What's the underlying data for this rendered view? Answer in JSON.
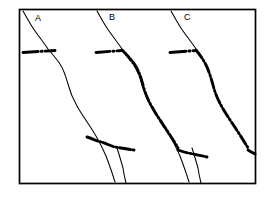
{
  "figure": {
    "type": "line-diagram",
    "panel_count": 3,
    "frame": {
      "x": 19,
      "y": 9,
      "width": 237,
      "height": 175,
      "stroke": "#000000",
      "stroke_width": 1.6
    },
    "background_color": "#ffffff",
    "ink_color": "#000000",
    "caption": ""
  },
  "panels": [
    {
      "id": "A",
      "label": "A",
      "label_x": 35,
      "label_y": 14,
      "thin_curve": "M 22,11 C 28,22 33,27 41,38 C 47,46 50,52 54,62 C 58,72 61,82 68,96 C 76,112 84,128 93,142 C 99,151 104,160 110,173 C 112,178 114,181 116,183",
      "dash_line": "M 22,52 L 50,50",
      "dash_line_2": "M 85,137 L 134,148",
      "dashed_overlay": "",
      "description": "thin sinuous line crossed by short thick dash-dot segments at two levels"
    },
    {
      "id": "B",
      "label": "B",
      "label_x": 109,
      "label_y": 13,
      "thin_curve": "M 96,11 C 100,20 103,28 108,37 C 112,44 117,48 121,55 C 125,62 128,70 131,78 C 135,88 139,97 144,108 C 148,118 152,128 157,140 C 160,150 163,160 166,172 C 167,178 168,181 169,183",
      "dash_line": "M 95,52 L 118,50",
      "dash_line_2": "M 155,145 L 200,155",
      "dashed_overlay": "follows curve from y=48 down to y=152",
      "description": "dash-dot line tracks the sinuous curve along most of its length"
    },
    {
      "id": "C",
      "label": "C",
      "label_x": 184,
      "label_y": 13,
      "thin_curve": "M 170,11 C 174,20 178,28 183,37 C 187,44 191,48 195,55",
      "dash_line": "M 168,52 L 190,50",
      "dash_line_2": "M 230,162 L 254,168",
      "dashed_overlay": "dash-dot replaces curve entirely below y=48",
      "description": "dash-dot line fully replaces the sinuous curve below the junction"
    }
  ],
  "legend": {
    "thin_line_meaning": "thin sinuous line",
    "thick_dashdot_meaning": "thick dash-dot line"
  }
}
